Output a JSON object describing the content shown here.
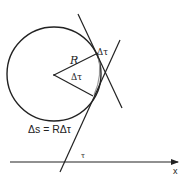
{
  "diagram": {
    "labels": {
      "radius": "R",
      "delta_tau_outer": "Δτ",
      "delta_tau_angle": "Δτ",
      "arc_formula": "Δs = RΔτ",
      "tau": "τ",
      "x_axis": "x"
    },
    "colors": {
      "stroke": "#222222",
      "arc_highlight": "#9a9a9a",
      "background": "#ffffff"
    }
  }
}
